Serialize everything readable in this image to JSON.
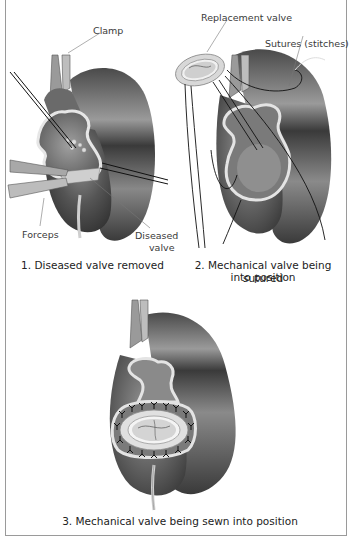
{
  "figure": {
    "panels": [
      {
        "id": 1,
        "caption": "1. Diseased valve removed",
        "labels": {
          "clamp": "Clamp",
          "forceps": "Forceps",
          "diseased_valve_line1": "Diseased",
          "diseased_valve_line2": "valve"
        }
      },
      {
        "id": 2,
        "caption_line1": "2. Mechanical valve being sutured",
        "caption_line2": "into position",
        "labels": {
          "replacement_valve": "Replacement valve",
          "sutures": "Sutures (stitches)"
        }
      },
      {
        "id": 3,
        "caption": "3. Mechanical valve being sewn into position"
      }
    ],
    "colors": {
      "heart_dark": "#3c3c3c",
      "heart_mid": "#6e6e6e",
      "heart_light": "#b8b8b8",
      "tissue_rim": "#e4e4e4",
      "frame": "#9a9a9a",
      "suture": "#111111"
    }
  }
}
